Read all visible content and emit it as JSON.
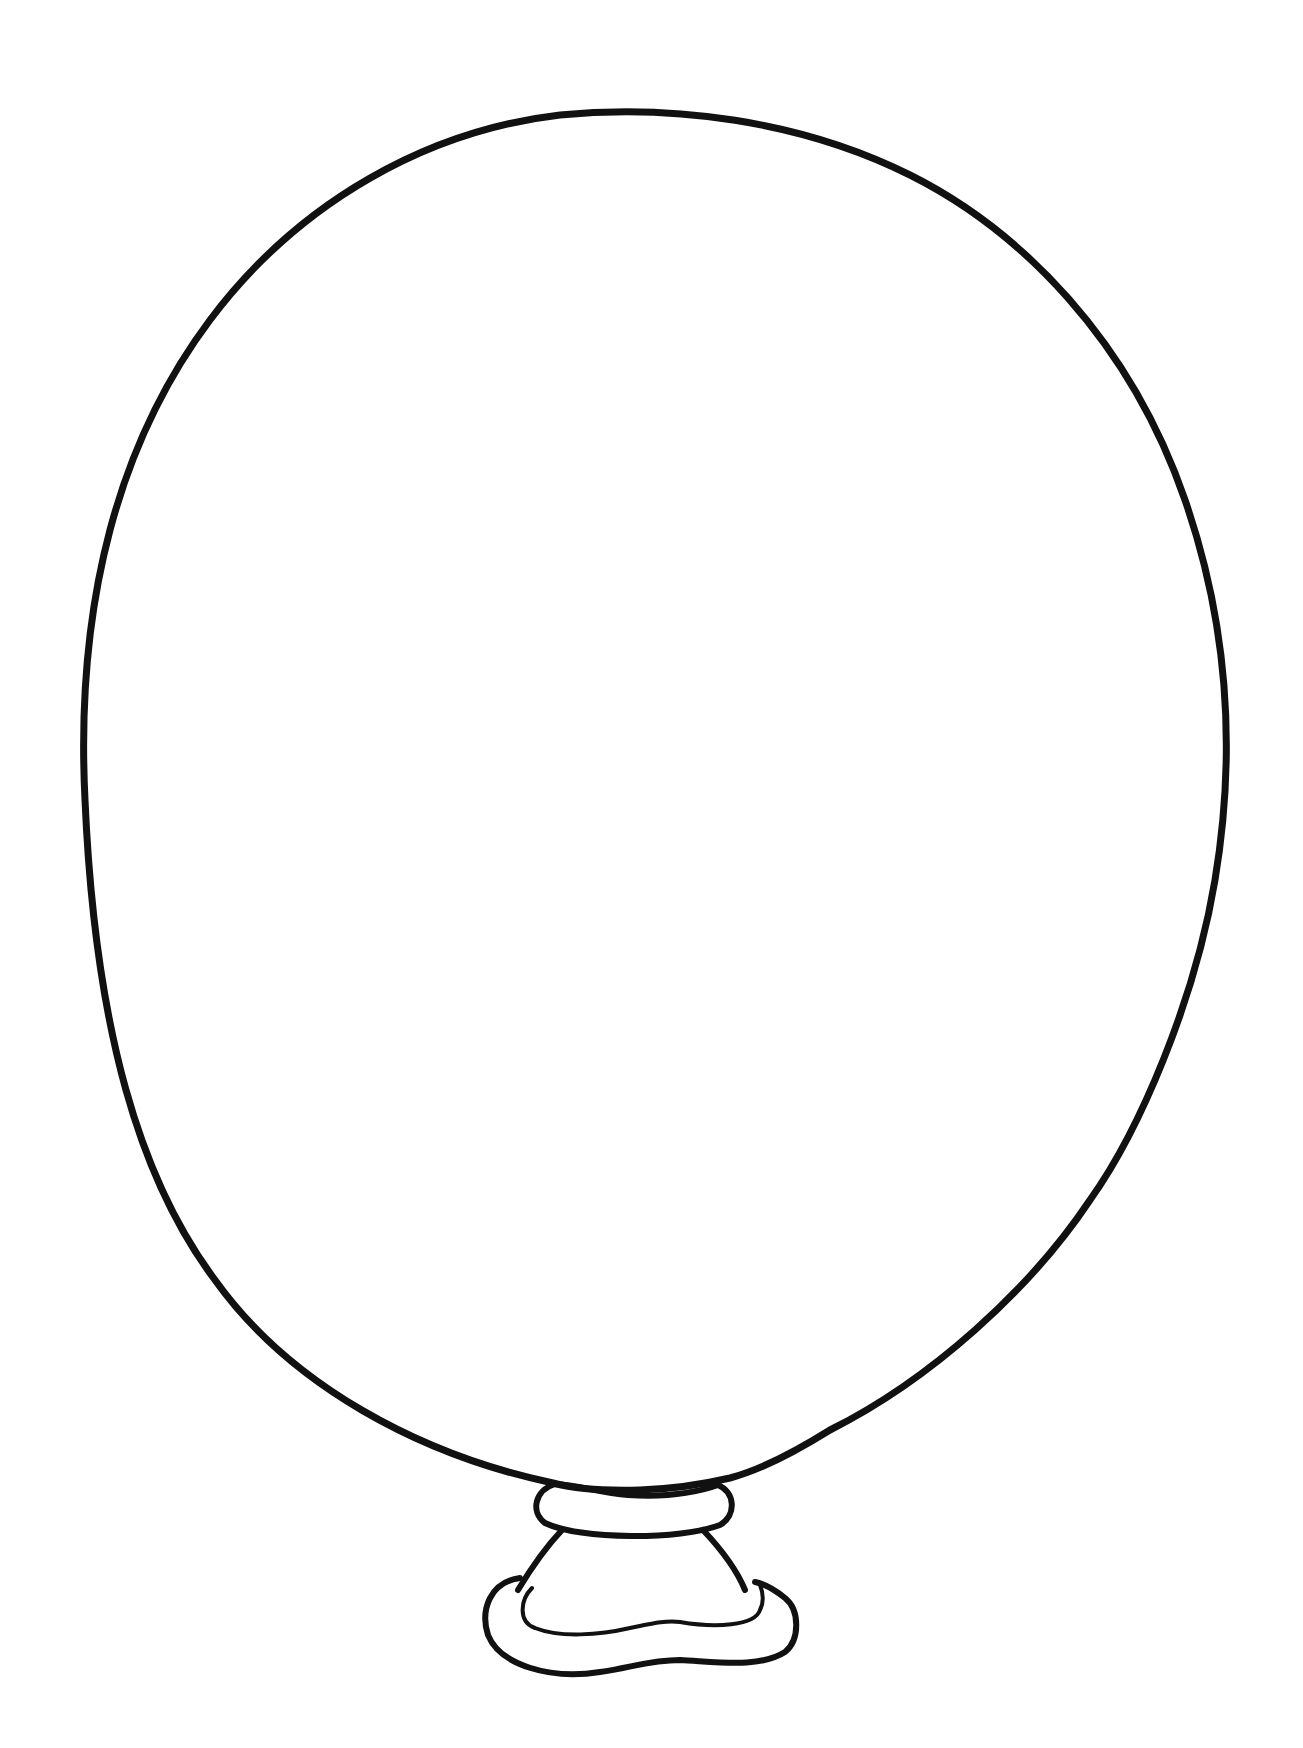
{
  "illustration": {
    "subject": "balloon outline",
    "background": "#ffffff",
    "stroke_color": "#111111",
    "outline_stroke_width": 7,
    "knot_stroke_width": 6,
    "knot_inner_stroke_width": 4
  }
}
